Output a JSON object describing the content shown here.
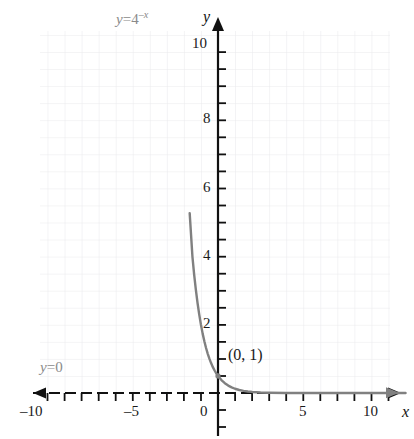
{
  "chart_data": {
    "type": "line",
    "title": "",
    "xlabel": "x",
    "ylabel": "y",
    "xlim": [
      -11.5,
      11.5
    ],
    "ylim": [
      -1.2,
      10.8
    ],
    "grid": true,
    "grid_step": 1,
    "legend": "none",
    "x_ticks_major": [
      -10,
      -5,
      0,
      5,
      10
    ],
    "x_tick_labels": [
      "–10",
      "–5",
      "0",
      "5",
      "10"
    ],
    "x_ticks_minor_step": 1,
    "y_ticks_major": [
      2,
      4,
      6,
      8,
      10
    ],
    "y_tick_labels": [
      "2",
      "4",
      "6",
      "8",
      "10"
    ],
    "y_ticks_minor_step": 0.5,
    "series": [
      {
        "name": "y = 4^(-x)",
        "expression": "4^(-x)",
        "base": 4,
        "color": "#808080",
        "x": [
          -1.661,
          -1.5,
          -1.4,
          -1.3,
          -1.2,
          -1.1,
          -1.0,
          -0.9,
          -0.8,
          -0.7,
          -0.6,
          -0.5,
          -0.4,
          -0.3,
          -0.2,
          -0.1,
          0.0,
          0.2,
          0.4,
          0.6,
          0.8,
          1.0,
          1.25,
          1.5,
          1.75,
          2.0,
          2.5,
          3.0,
          4.0,
          5.0,
          6.0,
          7.0,
          8.0,
          9.0,
          10.0,
          11.0
        ],
        "y": [
          10.55,
          8.0,
          6.964,
          6.063,
          5.278,
          4.595,
          4.0,
          3.482,
          3.031,
          2.639,
          2.297,
          2.0,
          1.741,
          1.516,
          1.32,
          1.149,
          1.0,
          0.758,
          0.574,
          0.435,
          0.33,
          0.25,
          0.177,
          0.125,
          0.088,
          0.0625,
          0.031,
          0.016,
          0.004,
          0.001,
          0.0,
          0.0,
          0.0,
          0.0,
          0.0,
          0.0
        ]
      }
    ],
    "asymptote": {
      "label": "y = 0",
      "value": 0,
      "axis": "horizontal"
    },
    "annotated_points": [
      {
        "label": "(0, 1)",
        "x": 0,
        "y": 1
      }
    ]
  },
  "labels": {
    "curve_equation": {
      "lhs": "y",
      "op": "=",
      "base": "4",
      "exponent": "–x"
    },
    "asymptote_text": {
      "lhs": "y",
      "op": "=",
      "rhs": "0"
    },
    "point_text": "(0, 1)",
    "x_axis_name": "x",
    "y_axis_name": "y"
  },
  "colors": {
    "curve": "#808080",
    "axis": "#111111",
    "grid": "#e8e8ea",
    "annotation_gray": "#8a8a8a",
    "tick_text": "#1a1a1a",
    "background": "#ffffff"
  }
}
